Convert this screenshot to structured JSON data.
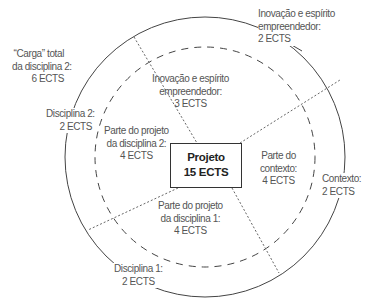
{
  "diagram": {
    "type": "concentric-circle-sector-diagram",
    "colors": {
      "outer_circle": "#444444",
      "inner_dashed_circle": "#444444",
      "dividers": "#666666",
      "text": "#555555",
      "center_text": "#222222"
    },
    "center": {
      "title": "Projeto",
      "value": "15 ECTS"
    },
    "inner_sectors": [
      {
        "lines": [
          "Inovação e espírito",
          "empreendedor:",
          "3 ECTS"
        ]
      },
      {
        "lines": [
          "Parte do projeto",
          "da disciplina 2:",
          "4 ECTS"
        ]
      },
      {
        "lines": [
          "Parte do",
          "contexto:",
          "4 ECTS"
        ]
      },
      {
        "lines": [
          "Parte do projeto",
          "da disciplina 1:",
          "4 ECTS"
        ]
      }
    ],
    "outer_labels": {
      "innovation": {
        "lines": [
          "Inovação e espírito",
          "empreendedor:",
          "2 ECTS"
        ]
      },
      "discipline2": {
        "lines": [
          "Disciplina 2:",
          "2 ECTS"
        ]
      },
      "context": {
        "lines": [
          "Contexto:",
          "2 ECTS"
        ]
      },
      "discipline1": {
        "lines": [
          "Disciplina 1:",
          "2 ECTS"
        ]
      }
    },
    "total_load_label": {
      "lines": [
        "“Carga” total",
        "da disciplina 2:",
        "6 ECTS"
      ]
    }
  }
}
